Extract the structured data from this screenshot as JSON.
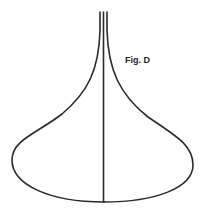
{
  "figure": {
    "label": "Fig. D",
    "stroke_color": "#2a2a2a",
    "background": "#ffffff",
    "shape": "flared-bell-outline-with-center-axis",
    "label_position": {
      "x": 125,
      "y": 55
    }
  }
}
